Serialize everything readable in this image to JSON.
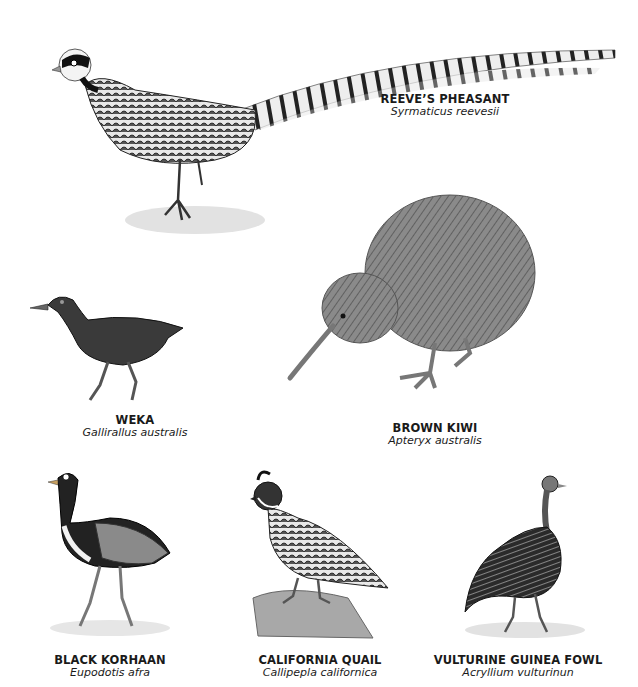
{
  "plate": {
    "birds": [
      {
        "id": "reeves-pheasant",
        "common_name": "REEVE’S PHEASANT",
        "scientific_name": "Syrmaticus reevesii"
      },
      {
        "id": "weka",
        "common_name": "WEKA",
        "scientific_name": "Gallirallus australis"
      },
      {
        "id": "brown-kiwi",
        "common_name": "BROWN KIWI",
        "scientific_name": "Apteryx australis"
      },
      {
        "id": "black-korhaan",
        "common_name": "BLACK KORHAAN",
        "scientific_name": "Eupodotis afra"
      },
      {
        "id": "california-quail",
        "common_name": "CALIFORNIA QUAIL",
        "scientific_name": "Callipepla californica"
      },
      {
        "id": "vulturine-guinea-fowl",
        "common_name": "VULTURINE GUINEA FOWL",
        "scientific_name": "Acryllium vulturinun"
      }
    ]
  },
  "colors": {
    "background": "#ffffff",
    "ink": "#1a1a1a",
    "mid": "#6e6e6e",
    "light": "#bdbdbd"
  }
}
